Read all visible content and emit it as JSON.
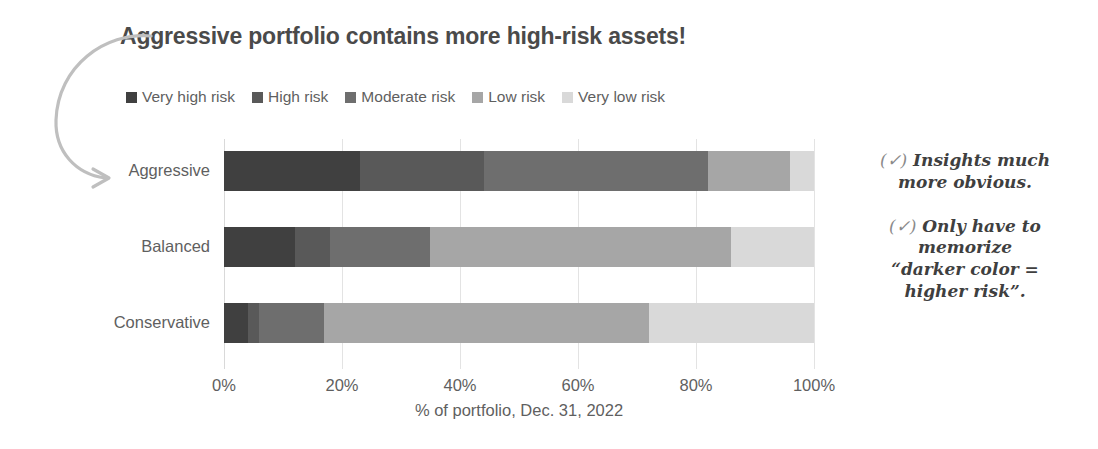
{
  "chart_data": {
    "type": "bar",
    "orientation": "horizontal",
    "stacked": true,
    "percent": true,
    "title": "Aggressive portfolio contains more high-risk assets!",
    "xlabel": "% of portfolio, Dec. 31, 2022",
    "ylabel": "",
    "xlim": [
      0,
      100
    ],
    "xticks": [
      0,
      20,
      40,
      60,
      80,
      100
    ],
    "xticklabels": [
      "0%",
      "20%",
      "40%",
      "60%",
      "80%",
      "100%"
    ],
    "grid": "vertical",
    "legend_position": "top-left",
    "categories": [
      "Aggressive",
      "Balanced",
      "Conservative"
    ],
    "series": [
      {
        "name": "Very high risk",
        "color": "#404040",
        "values": [
          23,
          12,
          4
        ]
      },
      {
        "name": "High risk",
        "color": "#595959",
        "values": [
          21,
          6,
          2
        ]
      },
      {
        "name": "Moderate risk",
        "color": "#6e6e6e",
        "values": [
          38,
          17,
          11
        ]
      },
      {
        "name": "Low risk",
        "color": "#a6a6a6",
        "values": [
          14,
          51,
          55
        ]
      },
      {
        "name": "Very low risk",
        "color": "#d9d9d9",
        "values": [
          4,
          14,
          28
        ]
      }
    ]
  },
  "legend": {
    "items": [
      {
        "label": "Very high risk",
        "color": "#404040"
      },
      {
        "label": "High risk",
        "color": "#595959"
      },
      {
        "label": "Moderate risk",
        "color": "#6e6e6e"
      },
      {
        "label": "Low risk",
        "color": "#a6a6a6"
      },
      {
        "label": "Very low risk",
        "color": "#d9d9d9"
      }
    ]
  },
  "annotations": {
    "callout_target": "Aggressive",
    "items": [
      {
        "check": "(✓)",
        "lines": [
          "Insights much",
          "more obvious."
        ]
      },
      {
        "check": "(✓)",
        "lines": [
          "Only have to",
          "memorize",
          "“darker color =",
          "higher risk”."
        ]
      }
    ]
  },
  "colors": {
    "text": "#5f5f5f",
    "title": "#4a4a4a",
    "gridline": "#e3e3e3",
    "arrow": "#bfbfbf"
  }
}
